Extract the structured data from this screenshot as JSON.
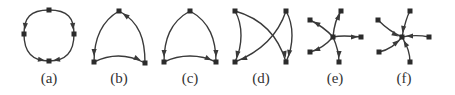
{
  "figure": {
    "panels": [
      {
        "id": "a",
        "label": "(a)",
        "label_pos": [
          49,
          83
        ],
        "nodes": [
          [
            49,
            10
          ],
          [
            24,
            34
          ],
          [
            74,
            34
          ],
          [
            49,
            61
          ]
        ],
        "edges": [
          {
            "d": "M49,10 C30,10 24,18 24,34",
            "arrow_at": [
              25,
              27
            ],
            "arrow_dir": 95
          },
          {
            "d": "M49,10 C68,10 74,18 74,34",
            "arrow_at": [
              73,
              27
            ],
            "arrow_dir": 85
          },
          {
            "d": "M24,34 C24,52 32,61 49,61",
            "arrow_at": [
              42,
              60
            ],
            "arrow_dir": 10
          },
          {
            "d": "M74,34 C74,52 66,61 49,61",
            "arrow_at": [
              56,
              60
            ],
            "arrow_dir": 170
          }
        ]
      },
      {
        "id": "b",
        "label": "(b)",
        "label_pos": [
          119,
          83
        ],
        "nodes": [
          [
            119,
            11
          ],
          [
            94,
            62
          ],
          [
            145,
            63
          ]
        ],
        "edges": [
          {
            "d": "M119,11 C100,22 94,40 94,62",
            "arrow_at": [
              94,
              53
            ],
            "arrow_dir": 92
          },
          {
            "d": "M145,63 C145,40 140,22 119,11",
            "arrow_at": [
              125,
              15
            ],
            "arrow_dir": 215
          },
          {
            "d": "M94,62 C110,54 128,54 145,63",
            "arrow_at": [
              138,
              59
            ],
            "arrow_dir": 25
          }
        ]
      },
      {
        "id": "c",
        "label": "(c)",
        "label_pos": [
          190,
          83
        ],
        "nodes": [
          [
            190,
            11
          ],
          [
            164,
            62
          ],
          [
            216,
            62
          ]
        ],
        "edges": [
          {
            "d": "M190,11 C170,22 164,40 164,62",
            "arrow_at": [
              164,
              54
            ],
            "arrow_dir": 92
          },
          {
            "d": "M190,11 C210,22 216,40 216,62",
            "arrow_at": [
              216,
              54
            ],
            "arrow_dir": 88
          },
          {
            "d": "M164,62 C180,54 200,54 216,62",
            "arrow_at": [
              209,
              59
            ],
            "arrow_dir": 25
          }
        ]
      },
      {
        "id": "d",
        "label": "(d)",
        "label_pos": [
          261,
          83
        ],
        "nodes": [
          [
            235,
            11
          ],
          [
            286,
            11
          ],
          [
            235,
            62
          ],
          [
            286,
            62
          ]
        ],
        "edges": [
          {
            "d": "M235,11 C243,25 243,45 235,62",
            "arrow_at": [
              237,
              55
            ],
            "arrow_dir": 105
          },
          {
            "d": "M235,11 C260,18 278,35 286,62",
            "arrow_at": [
              285,
              55
            ],
            "arrow_dir": 78
          },
          {
            "d": "M286,11 C278,35 260,52 235,62",
            "arrow_at": [
              243,
              59
            ],
            "arrow_dir": 160
          },
          {
            "d": "M286,11 C294,25 294,45 286,62",
            "arrow_at": [
              289,
              54
            ],
            "arrow_dir": 100
          }
        ]
      },
      {
        "id": "e",
        "label": "(e)",
        "label_pos": [
          335,
          83
        ],
        "center": [
          333,
          37
        ],
        "nodes": [
          [
            333,
            37
          ],
          [
            310,
            20
          ],
          [
            341,
            11
          ],
          [
            361,
            37
          ],
          [
            339,
            62
          ],
          [
            310,
            52
          ]
        ],
        "edges": [
          {
            "d": "M333,37 C325,28 318,24 310,20",
            "arrow_at": [
              316,
              23
            ],
            "arrow_dir": 210
          },
          {
            "d": "M333,37 C334,26 336,18 341,11",
            "arrow_at": [
              339,
              16
            ],
            "arrow_dir": 295
          },
          {
            "d": "M333,37 C342,35 350,36 361,37",
            "arrow_at": [
              355,
              37
            ],
            "arrow_dir": 0
          },
          {
            "d": "M333,37 C337,46 339,54 339,62",
            "arrow_at": [
              339,
              55
            ],
            "arrow_dir": 90
          },
          {
            "d": "M333,37 C326,45 318,50 310,52",
            "arrow_at": [
              316,
              50
            ],
            "arrow_dir": 160
          }
        ]
      },
      {
        "id": "f",
        "label": "(f)",
        "label_pos": [
          404,
          83
        ],
        "center": [
          402,
          37
        ],
        "nodes": [
          [
            402,
            37
          ],
          [
            378,
            20
          ],
          [
            410,
            11
          ],
          [
            429,
            37
          ],
          [
            410,
            62
          ],
          [
            379,
            52
          ]
        ],
        "edges": [
          {
            "d": "M378,20 C386,28 393,33 402,37",
            "arrow_at": [
              396,
              35
            ],
            "arrow_dir": 30
          },
          {
            "d": "M410,11 C406,18 404,27 402,37",
            "arrow_at": [
              403,
              30
            ],
            "arrow_dir": 100
          },
          {
            "d": "M429,37 C420,35 412,35 402,37",
            "arrow_at": [
              409,
              36
            ],
            "arrow_dir": 180
          },
          {
            "d": "M410,62 C410,54 407,45 402,37",
            "arrow_at": [
              405,
              43
            ],
            "arrow_dir": 240
          },
          {
            "d": "M379,52 C388,50 396,45 402,37",
            "arrow_at": [
              397,
              42
            ],
            "arrow_dir": 320
          }
        ]
      }
    ]
  },
  "colors": {
    "stroke": "#3a3a3a",
    "node": "#2b2b2b",
    "label": "#333333",
    "background": "#ffffff"
  }
}
